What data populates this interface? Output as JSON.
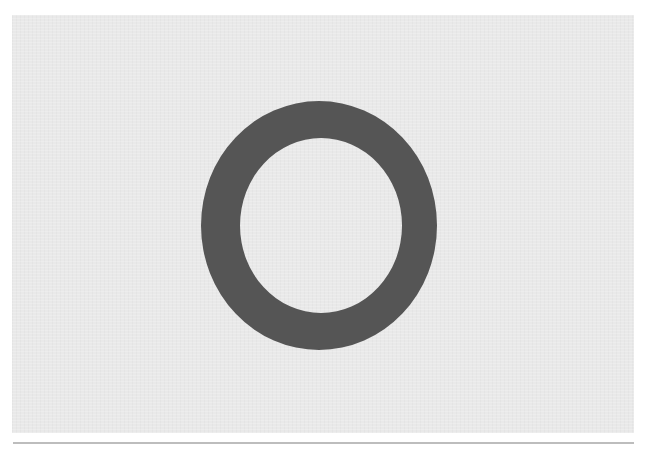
{
  "image": {
    "description": "Dark gray elliptical ring centered on a light gray textured panel, with a thin gray rule underneath",
    "background_color": "#ffffff",
    "panel_color": "#e9e9e9",
    "ring": {
      "shape": "ring-icon",
      "color": "#555555",
      "outer": {
        "cx": 319,
        "cy": 225.5,
        "rx": 118,
        "ry": 124.5
      },
      "inner": {
        "cx": 321,
        "cy": 225.5,
        "rx": 81,
        "ry": 87.5
      }
    },
    "separator_color": "#bdbdbd"
  }
}
